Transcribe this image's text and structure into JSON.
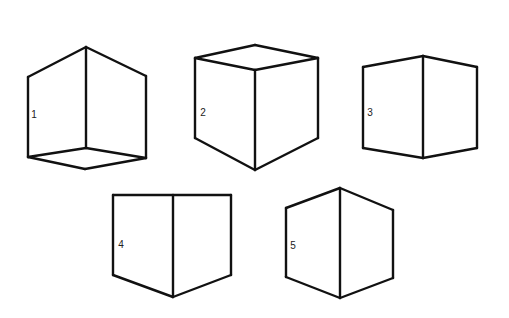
{
  "diagram": {
    "title": "",
    "stroke_color": "#111111",
    "background": "#ffffff",
    "figures": [
      {
        "id": "cube-1",
        "label": "1",
        "label_pos": [
          34,
          115
        ],
        "description": "cube viewed from below: two side faces and bottom face visible",
        "edges": [
          [
            [
              28,
              77
            ],
            [
              86,
              47
            ]
          ],
          [
            [
              86,
              47
            ],
            [
              146,
              76
            ]
          ],
          [
            [
              28,
              77
            ],
            [
              28,
              157
            ]
          ],
          [
            [
              86,
              47
            ],
            [
              86,
              148
            ]
          ],
          [
            [
              146,
              76
            ],
            [
              146,
              158
            ]
          ],
          [
            [
              28,
              157
            ],
            [
              86,
              148
            ]
          ],
          [
            [
              86,
              148
            ],
            [
              146,
              158
            ]
          ],
          [
            [
              28,
              157
            ],
            [
              85,
              169
            ]
          ],
          [
            [
              85,
              169
            ],
            [
              146,
              158
            ]
          ]
        ]
      },
      {
        "id": "cube-2",
        "label": "2",
        "label_pos": [
          203,
          113
        ],
        "description": "cube viewed from above: top face and two side faces visible",
        "edges": [
          [
            [
              195,
              58
            ],
            [
              255,
              45
            ]
          ],
          [
            [
              255,
              45
            ],
            [
              318,
              58
            ]
          ],
          [
            [
              195,
              58
            ],
            [
              255,
              70
            ]
          ],
          [
            [
              255,
              70
            ],
            [
              318,
              58
            ]
          ],
          [
            [
              195,
              58
            ],
            [
              195,
              138
            ]
          ],
          [
            [
              255,
              70
            ],
            [
              255,
              170
            ]
          ],
          [
            [
              318,
              58
            ],
            [
              318,
              138
            ]
          ],
          [
            [
              195,
              138
            ],
            [
              255,
              170
            ]
          ],
          [
            [
              255,
              170
            ],
            [
              318,
              138
            ]
          ]
        ]
      },
      {
        "id": "cube-3",
        "label": "3",
        "label_pos": [
          370,
          113
        ],
        "description": "two side faces at eye level, slight convergence top and bottom",
        "edges": [
          [
            [
              363,
              67
            ],
            [
              423,
              56
            ]
          ],
          [
            [
              423,
              56
            ],
            [
              477,
              67
            ]
          ],
          [
            [
              363,
              67
            ],
            [
              363,
              148
            ]
          ],
          [
            [
              423,
              56
            ],
            [
              423,
              158
            ]
          ],
          [
            [
              477,
              67
            ],
            [
              477,
              148
            ]
          ],
          [
            [
              363,
              148
            ],
            [
              423,
              158
            ]
          ],
          [
            [
              423,
              158
            ],
            [
              477,
              148
            ]
          ]
        ]
      },
      {
        "id": "cube-4",
        "label": "4",
        "label_pos": [
          121,
          245
        ],
        "description": "two side faces with flat top edge and pointed bottom",
        "edges": [
          [
            [
              113,
              195
            ],
            [
              231,
              195
            ]
          ],
          [
            [
              113,
              195
            ],
            [
              113,
              275
            ]
          ],
          [
            [
              173,
              195
            ],
            [
              173,
              297
            ]
          ],
          [
            [
              231,
              195
            ],
            [
              231,
              275
            ]
          ],
          [
            [
              113,
              275
            ],
            [
              173,
              297
            ]
          ],
          [
            [
              173,
              297
            ],
            [
              231,
              275
            ]
          ]
        ]
      },
      {
        "id": "cube-5",
        "label": "5",
        "label_pos": [
          293,
          246
        ],
        "description": "two side faces, pointed top and pointed bottom (hexagonal outline)",
        "edges": [
          [
            [
              286,
              208
            ],
            [
              340,
              188
            ]
          ],
          [
            [
              340,
              188
            ],
            [
              393,
              210
            ]
          ],
          [
            [
              286,
              208
            ],
            [
              286,
              277
            ]
          ],
          [
            [
              340,
              188
            ],
            [
              340,
              298
            ]
          ],
          [
            [
              393,
              210
            ],
            [
              393,
              278
            ]
          ],
          [
            [
              286,
              277
            ],
            [
              340,
              298
            ]
          ],
          [
            [
              340,
              298
            ],
            [
              393,
              278
            ]
          ]
        ]
      }
    ]
  }
}
